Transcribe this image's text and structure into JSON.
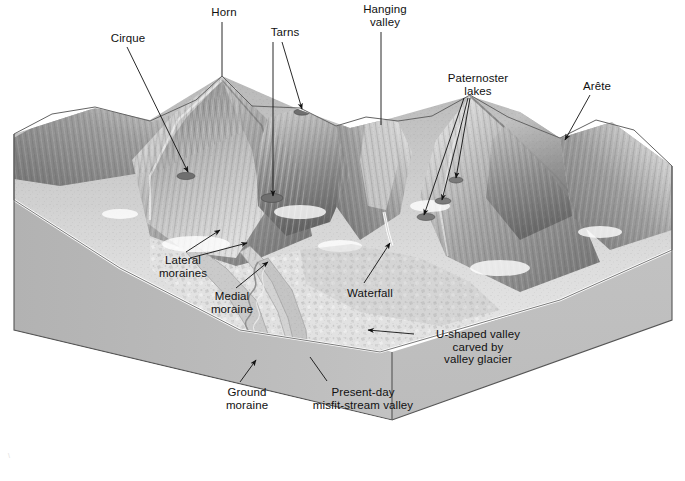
{
  "figure": {
    "kind": "block-diagram",
    "background_color": "#ffffff",
    "block_side_color": "#b9b9b9",
    "block_top_color": "#c6c6c6",
    "terrain_color_light": "#e8e8e8",
    "terrain_color_dark": "#6e6e6e",
    "leader_color": "#1a1a1a",
    "label_color": "#111111"
  },
  "labels": [
    {
      "id": "horn",
      "text": "Horn",
      "x": 196,
      "y": 6,
      "w": 56,
      "align": "center"
    },
    {
      "id": "cirque",
      "text": "Cirque",
      "x": 100,
      "y": 32,
      "w": 56,
      "align": "center"
    },
    {
      "id": "tarns",
      "text": "Tarns",
      "x": 259,
      "y": 26,
      "w": 52,
      "align": "center"
    },
    {
      "id": "hanging-valley",
      "text": "Hanging\nvalley",
      "x": 352,
      "y": 3,
      "w": 66,
      "align": "center"
    },
    {
      "id": "paternoster",
      "text": "Paternoster\nlakes",
      "x": 432,
      "y": 72,
      "w": 92,
      "align": "center"
    },
    {
      "id": "arete",
      "text": "Arête",
      "x": 570,
      "y": 80,
      "w": 54,
      "align": "center"
    },
    {
      "id": "lateral-moraines",
      "text": "Lateral\nmoraines",
      "x": 146,
      "y": 254,
      "w": 74,
      "align": "center"
    },
    {
      "id": "medial-moraine",
      "text": "Medial\nmoraine",
      "x": 196,
      "y": 290,
      "w": 72,
      "align": "center"
    },
    {
      "id": "waterfall",
      "text": "Waterfall",
      "x": 338,
      "y": 287,
      "w": 64,
      "align": "center"
    },
    {
      "id": "u-shaped-valley",
      "text": "U-shaped valley\ncarved by\nvalley glacier",
      "x": 420,
      "y": 328,
      "w": 116,
      "align": "center"
    },
    {
      "id": "ground-moraine",
      "text": "Ground\nmoraine",
      "x": 212,
      "y": 386,
      "w": 70,
      "align": "center"
    },
    {
      "id": "misfit-stream",
      "text": "Present-day\nmisfit-stream valley",
      "x": 298,
      "y": 386,
      "w": 130,
      "align": "center"
    }
  ],
  "leaders": [
    {
      "id": "leader-horn",
      "label": "horn",
      "points": "222,22 222,76",
      "arrow": "none"
    },
    {
      "id": "leader-cirque",
      "label": "cirque",
      "points": "127,47 188,172",
      "arrow": "end"
    },
    {
      "id": "leader-tarns-a",
      "label": "tarns",
      "points": "273,42 273,196",
      "arrow": "end"
    },
    {
      "id": "leader-tarns-b",
      "label": "tarns",
      "points": "282,42 302,109",
      "arrow": "end"
    },
    {
      "id": "leader-hanging-valley",
      "label": "hanging-valley",
      "points": "381,32 381,125",
      "arrow": "none"
    },
    {
      "id": "leader-paternoster-a",
      "label": "paternoster",
      "points": "464,98 424,215",
      "arrow": "end"
    },
    {
      "id": "leader-paternoster-b",
      "label": "paternoster",
      "points": "468,98 442,200",
      "arrow": "end"
    },
    {
      "id": "leader-paternoster-c",
      "label": "paternoster",
      "points": "470,98 456,178",
      "arrow": "end"
    },
    {
      "id": "leader-arete",
      "label": "arete",
      "points": "590,95 565,140",
      "arrow": "end"
    },
    {
      "id": "leader-lateral-a",
      "label": "lateral-moraines",
      "points": "186,252 220,230",
      "arrow": "end"
    },
    {
      "id": "leader-lateral-b",
      "label": "lateral-moraines",
      "points": "190,258 247,243",
      "arrow": "end"
    },
    {
      "id": "leader-medial",
      "label": "medial-moraine",
      "points": "236,288 268,262",
      "arrow": "end"
    },
    {
      "id": "leader-waterfall",
      "label": "waterfall",
      "points": "364,283 390,243",
      "arrow": "end"
    },
    {
      "id": "leader-u-shaped",
      "label": "u-shaped-valley",
      "points": "414,334 368,330",
      "arrow": "end"
    },
    {
      "id": "leader-ground-moraine",
      "label": "ground-moraine",
      "points": "240,382 256,360",
      "arrow": "end"
    },
    {
      "id": "leader-misfit",
      "label": "misfit-stream",
      "points": "327,381 310,357",
      "arrow": "none"
    }
  ],
  "credit": "\\"
}
